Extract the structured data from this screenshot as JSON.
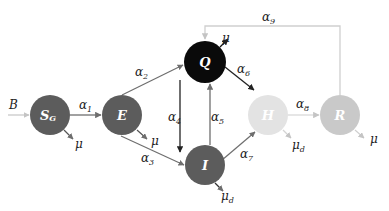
{
  "diagram": {
    "type": "compartmental-model",
    "nodes": [
      {
        "id": "SG",
        "label": "S",
        "sub": "G",
        "cx": 50,
        "cy": 115,
        "r": 20,
        "fill": "#5c5c5c"
      },
      {
        "id": "E",
        "label": "E",
        "sub": "",
        "cx": 122,
        "cy": 115,
        "r": 20,
        "fill": "#5c5c5c"
      },
      {
        "id": "Q",
        "label": "Q",
        "sub": "",
        "cx": 205,
        "cy": 62,
        "r": 21,
        "fill": "#0a0a0a"
      },
      {
        "id": "I",
        "label": "I",
        "sub": "",
        "cx": 205,
        "cy": 165,
        "r": 20,
        "fill": "#5c5c5c"
      },
      {
        "id": "H",
        "label": "H",
        "sub": "",
        "cx": 268,
        "cy": 115,
        "r": 20,
        "fill": "#e3e3e3"
      },
      {
        "id": "R",
        "label": "R",
        "sub": "",
        "cx": 340,
        "cy": 115,
        "r": 20,
        "fill": "#c9c9c9"
      }
    ],
    "inflow": {
      "label": "B"
    },
    "rates": {
      "a1": {
        "sym": "α",
        "sub": "1"
      },
      "a2": {
        "sym": "α",
        "sub": "2"
      },
      "a3": {
        "sym": "α",
        "sub": "3"
      },
      "a4": {
        "sym": "α",
        "sub": "4"
      },
      "a5": {
        "sym": "α",
        "sub": "5"
      },
      "a6": {
        "sym": "α",
        "sub": "6"
      },
      "a7": {
        "sym": "α",
        "sub": "7"
      },
      "a8": {
        "sym": "α",
        "sub": "8"
      },
      "a9": {
        "sym": "α",
        "sub": "9"
      }
    },
    "outflows": {
      "SG": {
        "sym": "μ",
        "sub": ""
      },
      "E": {
        "sym": "μ",
        "sub": ""
      },
      "Q": {
        "sym": "μ",
        "sub": ""
      },
      "I": {
        "sym": "μ",
        "sub": "d"
      },
      "H": {
        "sym": "μ",
        "sub": "d"
      },
      "R": {
        "sym": "μ",
        "sub": ""
      }
    },
    "edges": [
      {
        "from": "B",
        "to": "SG",
        "label": "B"
      },
      {
        "from": "SG",
        "to": "E",
        "label": "α1"
      },
      {
        "from": "E",
        "to": "Q",
        "label": "α2"
      },
      {
        "from": "E",
        "to": "I",
        "label": "α3"
      },
      {
        "from": "Q",
        "to": "I",
        "label": "α4"
      },
      {
        "from": "I",
        "to": "Q",
        "label": "α5"
      },
      {
        "from": "Q",
        "to": "H",
        "label": "α6"
      },
      {
        "from": "I",
        "to": "H",
        "label": "α7"
      },
      {
        "from": "H",
        "to": "R",
        "label": "α8"
      },
      {
        "from": "R",
        "to": "Q",
        "label": "α9"
      }
    ],
    "colors": {
      "dark_node": "#5c5c5c",
      "q_node": "#0a0a0a",
      "h_node": "#e3e3e3",
      "r_node": "#c9c9c9",
      "dark_arrow": "#333333",
      "gray_arrow": "#777777",
      "light_arrow": "#cccccc"
    }
  }
}
